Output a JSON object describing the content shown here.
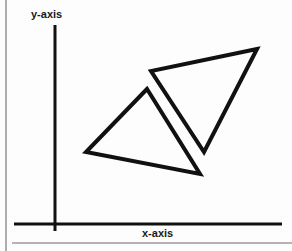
{
  "figure": {
    "background_color": "#fdfdfd",
    "ink_color": "#111111",
    "rule_color": "#9a9a9a",
    "width": 292,
    "height": 251
  },
  "axes": {
    "y_label": "y-axis",
    "x_label": "x-axis",
    "y_axis_line": {
      "x": 55,
      "y_top": 25,
      "y_bottom": 231
    },
    "x_axis_line": {
      "y": 224,
      "x_left": 14,
      "x_right": 282
    },
    "line_width": 3
  },
  "page_rules": {
    "left_vertical_rule": {
      "x": 6,
      "y_top": 0,
      "y_bottom": 251
    },
    "bottom_horizontal_rule": {
      "y": 243,
      "x_left": 12,
      "x_right": 292
    }
  },
  "shapes": [
    {
      "name": "triangle-upper-right",
      "vertices": [
        {
          "x": 257,
          "y": 49
        },
        {
          "x": 151,
          "y": 71
        },
        {
          "x": 204,
          "y": 152
        }
      ],
      "fill": "none",
      "stroke": "#111111",
      "stroke_width": 4
    },
    {
      "name": "triangle-lower-left",
      "vertices": [
        {
          "x": 147,
          "y": 89
        },
        {
          "x": 86,
          "y": 152
        },
        {
          "x": 200,
          "y": 174
        }
      ],
      "fill": "none",
      "stroke": "#111111",
      "stroke_width": 4
    }
  ],
  "chart_data": {
    "type": "scatter",
    "title": "",
    "xlabel": "x-axis",
    "ylabel": "y-axis",
    "grid": false,
    "legend": "none",
    "polygons": [
      {
        "name": "triangle-upper-right",
        "points": [
          [
            257,
            49
          ],
          [
            151,
            71
          ],
          [
            204,
            152
          ]
        ]
      },
      {
        "name": "triangle-lower-left",
        "points": [
          [
            147,
            89
          ],
          [
            86,
            152
          ],
          [
            200,
            174
          ]
        ]
      }
    ],
    "xlim": [
      14,
      282
    ],
    "ylim": [
      25,
      224
    ]
  }
}
